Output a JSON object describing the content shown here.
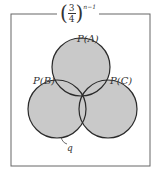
{
  "title": {
    "base_numerator": "3",
    "base_denominator": "4",
    "exponent": "n−1",
    "open_paren": "(",
    "close_paren": ")"
  },
  "circles": [
    {
      "label": "P(A)",
      "cx": 81,
      "cy": 67,
      "r": 29
    },
    {
      "label": "P(B)",
      "cx": 57,
      "cy": 109,
      "r": 29
    },
    {
      "label": "P(C)",
      "cx": 108,
      "cy": 109,
      "r": 29
    }
  ],
  "annotation": {
    "label": "q"
  },
  "colors": {
    "fill": "#c8c8c8",
    "stroke": "#2a2a2a",
    "frame": "#555555",
    "background": "#ffffff"
  }
}
